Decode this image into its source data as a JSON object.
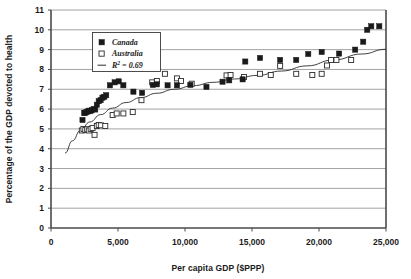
{
  "chart_data": {
    "type": "scatter",
    "title": "",
    "xlabel": "Per capita GDP ($PPP)",
    "ylabel": "Percentage of the GDP devoted to health",
    "xlim": [
      0,
      25000
    ],
    "ylim": [
      0,
      11
    ],
    "xticks": [
      0,
      5000,
      10000,
      15000,
      20000,
      25000
    ],
    "xticklabels": [
      "0",
      "5,000",
      "10,000",
      "15,000",
      "20,000",
      "25,000"
    ],
    "yticks": [
      0,
      1,
      2,
      3,
      4,
      5,
      6,
      7,
      8,
      9,
      10,
      11
    ],
    "yticklabels": [
      "0",
      "1",
      "2",
      "3",
      "4",
      "5",
      "6",
      "7",
      "8",
      "9",
      "10",
      "11"
    ],
    "grid": "horizontal",
    "legend_position": "upper-left-inside",
    "legend": [
      {
        "label": "Canada",
        "marker": "filled-square",
        "color": "#1a1a1a"
      },
      {
        "label": "Australia",
        "marker": "open-square",
        "color": "#ffffff"
      },
      {
        "label": "R² = 0.69",
        "marker": "line",
        "color": "#2b2b2b"
      }
    ],
    "legend_r2_prefix": "R",
    "legend_r2_sup": "2",
    "legend_r2_suffix": " = 0.69",
    "annotations": [],
    "series": [
      {
        "name": "Canada",
        "marker": "filled-square",
        "points": [
          [
            2350,
            5.45
          ],
          [
            2480,
            5.8
          ],
          [
            2560,
            5.82
          ],
          [
            2650,
            5.85
          ],
          [
            2740,
            5.88
          ],
          [
            2830,
            5.92
          ],
          [
            2950,
            5.9
          ],
          [
            3060,
            5.95
          ],
          [
            3180,
            6.0
          ],
          [
            3300,
            5.98
          ],
          [
            3420,
            6.22
          ],
          [
            3560,
            6.4
          ],
          [
            3700,
            6.45
          ],
          [
            3840,
            6.58
          ],
          [
            3980,
            6.62
          ],
          [
            4120,
            6.7
          ],
          [
            4400,
            7.2
          ],
          [
            4750,
            7.35
          ],
          [
            5050,
            7.4
          ],
          [
            5400,
            7.2
          ],
          [
            6150,
            6.88
          ],
          [
            6800,
            6.82
          ],
          [
            7600,
            7.22
          ],
          [
            7900,
            7.25
          ],
          [
            8700,
            7.2
          ],
          [
            9400,
            7.2
          ],
          [
            10400,
            7.22
          ],
          [
            11600,
            7.12
          ],
          [
            12800,
            7.38
          ],
          [
            13300,
            7.45
          ],
          [
            14300,
            7.5
          ],
          [
            14500,
            8.4
          ],
          [
            15600,
            8.58
          ],
          [
            17100,
            8.48
          ],
          [
            18300,
            8.48
          ],
          [
            19200,
            8.78
          ],
          [
            20200,
            8.88
          ],
          [
            21500,
            8.8
          ],
          [
            22700,
            9.0
          ],
          [
            23300,
            9.4
          ],
          [
            23600,
            10.0
          ],
          [
            23900,
            10.18
          ],
          [
            24500,
            10.18
          ]
        ]
      },
      {
        "name": "Australia",
        "marker": "open-square",
        "points": [
          [
            2300,
            4.92
          ],
          [
            2420,
            5.0
          ],
          [
            2560,
            4.95
          ],
          [
            2700,
            4.98
          ],
          [
            2820,
            4.92
          ],
          [
            2960,
            5.0
          ],
          [
            3100,
            5.05
          ],
          [
            3250,
            4.7
          ],
          [
            3420,
            5.15
          ],
          [
            3560,
            5.2
          ],
          [
            3720,
            5.18
          ],
          [
            4050,
            5.15
          ],
          [
            4600,
            5.7
          ],
          [
            4900,
            5.78
          ],
          [
            5400,
            5.78
          ],
          [
            6100,
            5.85
          ],
          [
            6750,
            6.45
          ],
          [
            7550,
            7.35
          ],
          [
            7900,
            7.42
          ],
          [
            8500,
            7.78
          ],
          [
            9400,
            7.55
          ],
          [
            9700,
            7.42
          ],
          [
            10500,
            7.28
          ],
          [
            13100,
            7.7
          ],
          [
            13400,
            7.72
          ],
          [
            14400,
            7.62
          ],
          [
            15600,
            7.78
          ],
          [
            16400,
            7.72
          ],
          [
            17100,
            8.18
          ],
          [
            18300,
            7.78
          ],
          [
            19500,
            7.72
          ],
          [
            20200,
            7.78
          ],
          [
            20600,
            8.2
          ],
          [
            20900,
            8.48
          ],
          [
            21300,
            8.48
          ],
          [
            22400,
            8.48
          ]
        ]
      }
    ],
    "trendline": {
      "label": "R² = 0.69",
      "points": [
        [
          1050,
          3.78
        ],
        [
          1600,
          4.4
        ],
        [
          2200,
          4.92
        ],
        [
          2900,
          5.35
        ],
        [
          3700,
          5.72
        ],
        [
          4600,
          6.05
        ],
        [
          5600,
          6.33
        ],
        [
          6700,
          6.58
        ],
        [
          7900,
          6.8
        ],
        [
          9200,
          7.0
        ],
        [
          10600,
          7.18
        ],
        [
          12100,
          7.35
        ],
        [
          13700,
          7.52
        ],
        [
          15400,
          7.7
        ],
        [
          17200,
          7.92
        ],
        [
          19100,
          8.18
        ],
        [
          21100,
          8.48
        ],
        [
          23200,
          8.78
        ],
        [
          25000,
          9.02
        ]
      ]
    }
  }
}
